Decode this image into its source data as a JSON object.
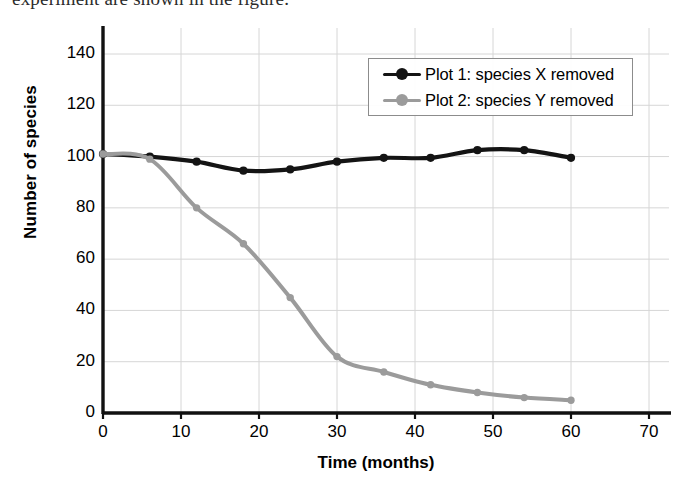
{
  "page": {
    "cropped_caption": "experiment are shown in the figure."
  },
  "chart_data": {
    "type": "line",
    "title": "",
    "xlabel": "Time (months)",
    "ylabel": "Number of species",
    "xlim": [
      0,
      70
    ],
    "ylim": [
      0,
      140
    ],
    "xticks": [
      0,
      10,
      20,
      30,
      40,
      50,
      60,
      70
    ],
    "yticks": [
      0,
      20,
      40,
      60,
      80,
      100,
      120,
      140
    ],
    "grid": true,
    "legend_position": "upper right",
    "x": [
      0,
      6,
      12,
      18,
      24,
      30,
      36,
      42,
      48,
      54,
      60
    ],
    "series": [
      {
        "name": "Plot 1: species X removed",
        "color": "#141414",
        "marker": "circle",
        "values": [
          101,
          100,
          98,
          94.5,
          95,
          98,
          99.5,
          99.5,
          102.5,
          102.5,
          99.5
        ]
      },
      {
        "name": "Plot 2: species Y removed",
        "color": "#9b9b9b",
        "marker": "circle",
        "values": [
          101,
          99,
          80,
          66,
          45,
          22,
          16,
          11,
          8,
          6,
          5
        ]
      }
    ]
  },
  "axis_style": {
    "axis_color": "#111111",
    "grid_color": "#d6d6d6",
    "legend_border": "#8c8c8c"
  }
}
